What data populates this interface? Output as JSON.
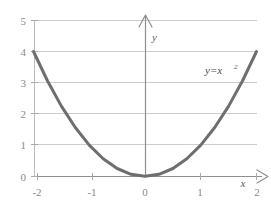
{
  "chart_data": {
    "type": "line",
    "title": "",
    "subtitle": "",
    "xlabel": "x",
    "ylabel": "y",
    "annotation": "y=x",
    "annotation_exponent": "2",
    "equation": "y=x^2",
    "xlim": [
      -2,
      2
    ],
    "ylim": [
      0,
      5
    ],
    "grid": true,
    "grid_axis": "y",
    "legend": "none",
    "x_ticks": [
      "-2",
      "-1",
      "0",
      "1",
      "2"
    ],
    "x_tick_values": [
      -2,
      -1,
      0,
      1,
      2
    ],
    "y_ticks": [
      "0",
      "1",
      "2",
      "3",
      "4",
      "5"
    ],
    "y_tick_values": [
      0,
      1,
      2,
      3,
      4,
      5
    ],
    "series": [
      {
        "name": "y=x^2",
        "x": [
          -2,
          -1.75,
          -1.5,
          -1.25,
          -1,
          -0.75,
          -0.5,
          -0.25,
          0,
          0.25,
          0.5,
          0.75,
          1,
          1.25,
          1.5,
          1.75,
          2
        ],
        "values": [
          4,
          3.0625,
          2.25,
          1.5625,
          1,
          0.5625,
          0.25,
          0.0625,
          0,
          0.0625,
          0.25,
          0.5625,
          1,
          1.5625,
          2.25,
          3.0625,
          4
        ]
      }
    ]
  },
  "colors": {
    "curve": "#6e6e6c",
    "grid": "#c9cfc9",
    "axis": "#8f8f8d",
    "tick_text": "#8a8a88",
    "label_text": "#4a4a48",
    "background": "#ffffff"
  },
  "axes": {
    "y_axis_label": "y",
    "x_axis_label": "x",
    "y_arrow": "arrow-up",
    "x_arrow": "arrow-right"
  }
}
